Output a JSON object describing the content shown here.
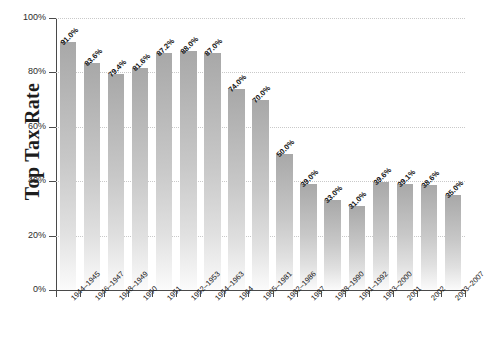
{
  "chart_data": {
    "type": "bar",
    "title": "",
    "subtitle": "",
    "xlabel": "",
    "ylabel": "Top Tax Rate",
    "ylim": [
      0,
      100
    ],
    "grid": true,
    "legend": false,
    "y_ticks": [
      "0%",
      "20%",
      "40%",
      "60%",
      "80%",
      "100%"
    ],
    "y_tick_values": [
      0,
      20,
      40,
      60,
      80,
      100
    ],
    "categories": [
      "1944–1945",
      "1946–1947",
      "1948–1949",
      "1950",
      "1951",
      "1952–1953",
      "1954–1963",
      "1964",
      "1965–1981",
      "1982–1986",
      "1987",
      "1988–1990",
      "1991–1992",
      "1993–2000",
      "2001",
      "2002",
      "2003–2007"
    ],
    "values": [
      91.0,
      83.6,
      79.4,
      81.6,
      87.2,
      88.0,
      87.0,
      74.0,
      70.0,
      50.0,
      39.0,
      33.0,
      31.0,
      39.6,
      39.1,
      38.6,
      35.0
    ],
    "value_labels": [
      "91.0%",
      "83.6%",
      "79.4%",
      "81.6%",
      "87.2%",
      "88.0%",
      "87.0%",
      "74.0%",
      "70.0%",
      "50.0%",
      "39.0%",
      "33.0%",
      "31.0%",
      "39.6%",
      "39.1%",
      "38.6%",
      "35.0%"
    ],
    "colors": {
      "bar_top": "#a8a8a8",
      "bar_bottom": "#fbfbfb",
      "gridline": "#c9c9c9",
      "axis": "#4a4a4a",
      "text": "#1d1d1d",
      "background": "#ffffff"
    }
  }
}
